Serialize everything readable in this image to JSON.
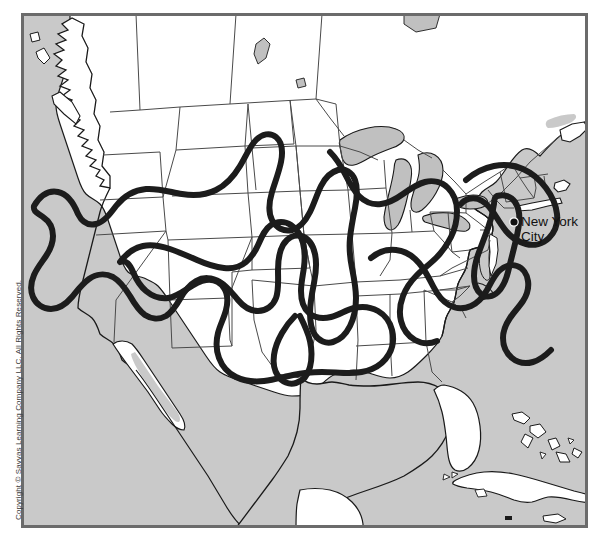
{
  "figure": {
    "type": "reference-map",
    "width": 604,
    "height": 544
  },
  "frame": {
    "x": 21,
    "y": 13,
    "width": 567,
    "height": 515,
    "border_color": "#6b6b6b",
    "border_width": 3
  },
  "colors": {
    "ocean": "#c9c9c9",
    "land": "#ffffff",
    "lake": "#c0c0c0",
    "border_line": "#3a3a3a",
    "coast_line": "#1a1a1a",
    "highlight_line": "#1c1c1c",
    "label_text": "#111111",
    "copyright_text": "#3c3c3c"
  },
  "labels": {
    "city": {
      "name": "New York City",
      "line1": "New York",
      "line2": "City",
      "marker": "dot",
      "x": 519,
      "y": 221
    }
  },
  "copyright": {
    "text": "Copyright © Savvas Learning Company LLC. All Rights Reserved.",
    "orientation": "vertical"
  },
  "map_content": {
    "water_bodies": [
      "Pacific Ocean",
      "Atlantic Ocean",
      "Gulf of Mexico",
      "Great Lakes"
    ],
    "land_masses": [
      "United States",
      "Canada",
      "Mexico",
      "Cuba",
      "Bahamas",
      "Baja California",
      "Yucatan Peninsula",
      "Long Island",
      "Florida"
    ],
    "overlay": {
      "description": "Thick dark closed curves outlining several regions",
      "line_style": "solid thick",
      "regions_count": 4
    }
  }
}
